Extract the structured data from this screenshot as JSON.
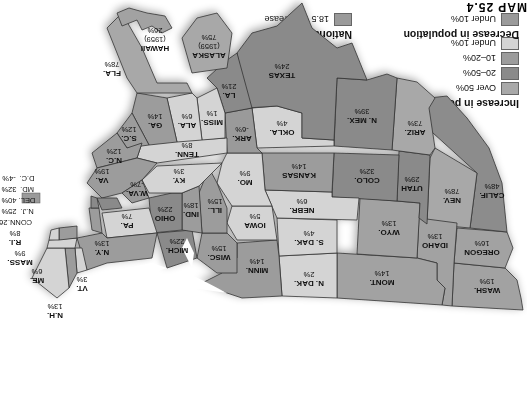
{
  "map": {
    "title": "MAP 25.4",
    "colors": {
      "over_50": "#a8a8a8",
      "20_50": "#8a8a8a",
      "10_20": "#9c9c9c",
      "under_10_inc": "#d4d4d4",
      "decrease": "#9a9a9a",
      "national": "#9a9a9a",
      "water": "#ffffff"
    },
    "legend": {
      "increase_title": "Increase in population",
      "increase_items": [
        {
          "label": "Over 50%"
        },
        {
          "label": "20–50%"
        },
        {
          "label": "10–20%"
        },
        {
          "label": "Under 10%"
        }
      ],
      "decrease_title": "Decrease in population",
      "decrease_items": [
        {
          "label": "Under 10%"
        }
      ],
      "national_title": "National average",
      "national_label": "18.5 % increase"
    },
    "states": [
      {
        "name": "WASH.",
        "value": "19%"
      },
      {
        "name": "OREGON",
        "value": "16%"
      },
      {
        "name": "CALIF.",
        "value": "48%"
      },
      {
        "name": "NEV.",
        "value": "78%"
      },
      {
        "name": "IDAHO",
        "value": "13%"
      },
      {
        "name": "MONT.",
        "value": "14%"
      },
      {
        "name": "WYO.",
        "value": "13%"
      },
      {
        "name": "UTAH",
        "value": "29%"
      },
      {
        "name": "ARIZ.",
        "value": "73%"
      },
      {
        "name": "COLO.",
        "value": "32%"
      },
      {
        "name": "N. MEX.",
        "value": "39%"
      },
      {
        "name": "N. DAK.",
        "value": "2%"
      },
      {
        "name": "S. DAK.",
        "value": "4%"
      },
      {
        "name": "NEBR.",
        "value": "6%"
      },
      {
        "name": "KANSAS",
        "value": "14%"
      },
      {
        "name": "OKLA.",
        "value": "4%"
      },
      {
        "name": "TEXAS",
        "value": "24%"
      },
      {
        "name": "MINN.",
        "value": "14%"
      },
      {
        "name": "IOWA",
        "value": "5%"
      },
      {
        "name": "MO.",
        "value": "9%"
      },
      {
        "name": "ARK.",
        "value": "-6%"
      },
      {
        "name": "LA.",
        "value": "21%"
      },
      {
        "name": "WISC.",
        "value": "15%"
      },
      {
        "name": "ILL.",
        "value": "15%"
      },
      {
        "name": "MICH.",
        "value": "22%"
      },
      {
        "name": "IND.",
        "value": "18%"
      },
      {
        "name": "OHIO",
        "value": "22%"
      },
      {
        "name": "KY.",
        "value": "3%"
      },
      {
        "name": "TENN.",
        "value": "8%"
      },
      {
        "name": "MISS.",
        "value": "1%"
      },
      {
        "name": "ALA.",
        "value": "6%"
      },
      {
        "name": "GA.",
        "value": "14%"
      },
      {
        "name": "FLA.",
        "value": "78%"
      },
      {
        "name": "S.C.",
        "value": "12%"
      },
      {
        "name": "N.C.",
        "value": "12%"
      },
      {
        "name": "VA.",
        "value": "19%"
      },
      {
        "name": "W.VA.",
        "value": "-7%"
      },
      {
        "name": "PA.",
        "value": "7%"
      },
      {
        "name": "N.Y.",
        "value": "13%"
      },
      {
        "name": "VT.",
        "value": "3%"
      },
      {
        "name": "N.H.",
        "value": "13%"
      },
      {
        "name": "ME.",
        "value": "6%"
      },
      {
        "name": "MASS.",
        "value": "9%"
      },
      {
        "name": "R.I.",
        "value": "8%"
      },
      {
        "name": "CONN.",
        "value": "26%"
      },
      {
        "name": "N.J.",
        "value": "25%"
      },
      {
        "name": "DEL.",
        "value": "40%"
      },
      {
        "name": "MD.",
        "value": "32%"
      },
      {
        "name": "D.C.",
        "value": "-4%"
      },
      {
        "name": "ALASKA",
        "year": "(1959)",
        "value": "75%"
      },
      {
        "name": "HAWAII",
        "year": "(1959)",
        "value": "26%"
      }
    ]
  }
}
